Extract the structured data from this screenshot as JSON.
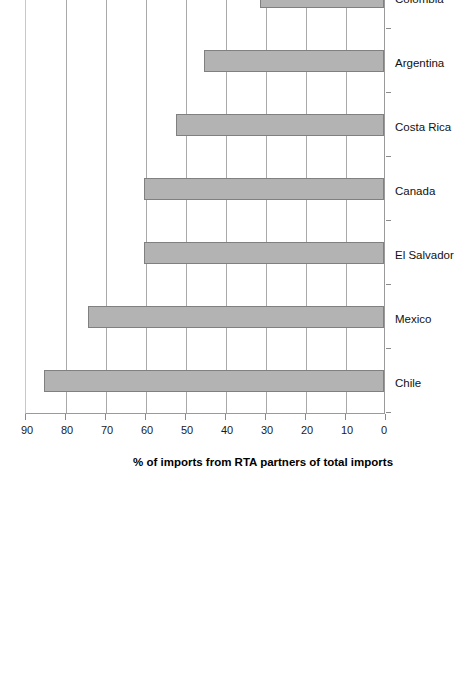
{
  "chart_data": {
    "type": "bar",
    "title": "",
    "xlabel": "",
    "ylabel": "% of imports from RTA partners of total imports",
    "ylim": [
      0,
      90
    ],
    "ytick_step": 10,
    "yticks": [
      "0",
      "10",
      "20",
      "30",
      "40",
      "50",
      "60",
      "70",
      "80",
      "90"
    ],
    "grid": true,
    "legend": false,
    "orientation": "rotated-90",
    "bar_color": "#b3b3b3",
    "bar_border_color": "#808080",
    "categories": [
      "Chile",
      "Mexico",
      "El Salvador",
      "Canada",
      "Costa Rica",
      "Argentina",
      "Colombia",
      "United States",
      "Brazil"
    ],
    "values": [
      85,
      74,
      60,
      60,
      52,
      45,
      31,
      30.5,
      16
    ]
  },
  "axis": {
    "value_axis_title": "% of imports from RTA partners of total imports"
  }
}
